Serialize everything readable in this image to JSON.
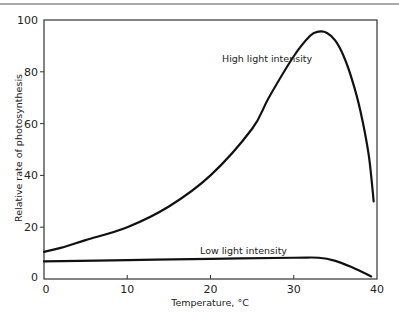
{
  "chart_data": {
    "type": "line",
    "title": "",
    "xlabel": "Temperature, °C",
    "ylabel": "Relative rate of photosynthesis",
    "xlim": [
      0,
      40
    ],
    "ylim": [
      0,
      100
    ],
    "xticks": [
      0,
      10,
      20,
      30,
      40
    ],
    "yticks": [
      0,
      20,
      40,
      60,
      80,
      100
    ],
    "grid": false,
    "legend": "none (curves labeled directly)",
    "series": [
      {
        "name": "High light intensity",
        "x": [
          0,
          2,
          5,
          10,
          15,
          20,
          25,
          27,
          30,
          32,
          33,
          34,
          35,
          36,
          37,
          38,
          39,
          39.6
        ],
        "y": [
          10.5,
          12,
          15,
          20,
          28,
          40,
          58,
          70,
          86,
          94,
          95.5,
          95,
          92,
          86,
          77,
          65,
          48,
          30
        ]
      },
      {
        "name": "Low light intensity",
        "x": [
          0,
          10,
          20,
          30,
          33,
          35,
          37,
          39.3
        ],
        "y": [
          6.8,
          7.3,
          7.8,
          8.2,
          8.2,
          7,
          4.5,
          1
        ]
      }
    ],
    "annotations": [
      {
        "text": "High light intensity",
        "x": 25,
        "y": 85
      },
      {
        "text": "Low light intensity",
        "x": 22,
        "y": 12
      }
    ]
  },
  "labels": {
    "xlabel": "Temperature, °C",
    "ylabel": "Relative rate of photosynthesis",
    "high": "High light intensity",
    "low": "Low light intensity"
  }
}
